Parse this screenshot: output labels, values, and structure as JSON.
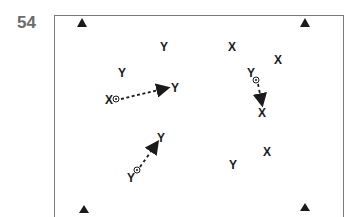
{
  "figure_number": "54",
  "players": [
    {
      "id": "y1",
      "label": "Y",
      "team": "Y"
    },
    {
      "id": "x1",
      "label": "X",
      "team": "X"
    },
    {
      "id": "y2",
      "label": "Y",
      "team": "Y"
    },
    {
      "id": "x2",
      "label": "X",
      "team": "X"
    },
    {
      "id": "y3",
      "label": "Y",
      "team": "Y"
    },
    {
      "id": "x3",
      "label": "X",
      "team": "X"
    },
    {
      "id": "x4",
      "label": "X",
      "team": "X"
    },
    {
      "id": "y4",
      "label": "Y",
      "team": "Y"
    },
    {
      "id": "x5",
      "label": "X",
      "team": "X"
    },
    {
      "id": "y5",
      "label": "Y",
      "team": "Y"
    },
    {
      "id": "x6",
      "label": "X",
      "team": "X"
    },
    {
      "id": "y6",
      "label": "Y",
      "team": "Y"
    },
    {
      "id": "x7",
      "label": "X",
      "team": "X"
    },
    {
      "id": "y7",
      "label": "Y",
      "team": "Y"
    }
  ],
  "cones": [
    "top-left",
    "top-right",
    "bottom-left",
    "bottom-right"
  ],
  "passes": [
    {
      "from": "x2",
      "to": "x3",
      "style": "dashed-arrow"
    },
    {
      "from": "y4",
      "to": "x5",
      "style": "dashed-arrow"
    },
    {
      "from": "y6",
      "to": "y5",
      "style": "dashed-arrow"
    }
  ],
  "ball_holders": [
    "x2",
    "y4",
    "y6"
  ],
  "colors": {
    "ink": "#1a1a1a",
    "frame": "#7a7a7a",
    "number": "#6b6b6b"
  }
}
